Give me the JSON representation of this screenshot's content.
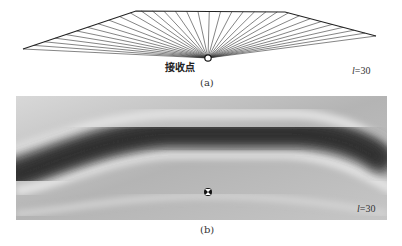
{
  "panel_a": {
    "caption": "(a)",
    "receiver_label": "接收点",
    "param_symbol": "l",
    "param_value": "=30",
    "boundary": [
      [
        23,
        49
      ],
      [
        136,
        11
      ],
      [
        285,
        12
      ],
      [
        376,
        36
      ]
    ],
    "receiver": [
      208,
      58
    ],
    "ray_count": 33
  },
  "panel_b": {
    "caption": "(b)",
    "param_symbol": "l",
    "param_value": "=30",
    "receiver": [
      192,
      96
    ]
  }
}
